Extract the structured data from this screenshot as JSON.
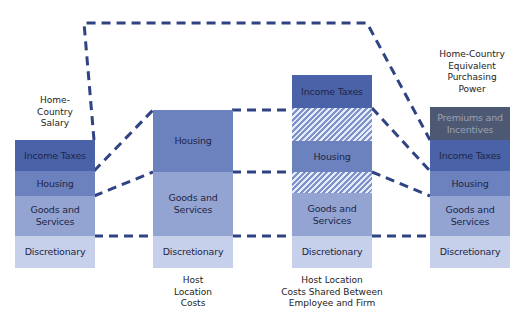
{
  "colors": {
    "income_taxes": "#4a63a8",
    "housing": "#6c82bf",
    "goods_services": "#93a4d3",
    "discretionary": "#c6d0ea",
    "premiums": "#4d5872",
    "premiums_text": "#9aa2b4",
    "connector": "#2f4383"
  },
  "columns": [
    {
      "caption": "Home-\nCountry\nSalary",
      "caption_position": "top",
      "segments": [
        {
          "label": "Income Taxes",
          "type": "income_taxes"
        },
        {
          "label": "Housing",
          "type": "housing"
        },
        {
          "label": "Goods and Services",
          "type": "goods_services"
        },
        {
          "label": "Discretionary",
          "type": "discretionary"
        }
      ]
    },
    {
      "caption": "Host\nLocation\nCosts",
      "caption_position": "bottom",
      "segments": [
        {
          "label": "Housing",
          "type": "housing"
        },
        {
          "label": "Goods and Services",
          "type": "goods_services"
        },
        {
          "label": "Discretionary",
          "type": "discretionary"
        }
      ]
    },
    {
      "caption": "Host Location\nCosts Shared Between\nEmployee and Firm",
      "caption_position": "bottom",
      "segments": [
        {
          "label": "Income Taxes",
          "type": "income_taxes"
        },
        {
          "label": "",
          "type": "hatch"
        },
        {
          "label": "Housing",
          "type": "housing"
        },
        {
          "label": "",
          "type": "hatch"
        },
        {
          "label": "Goods and Services",
          "type": "goods_services"
        },
        {
          "label": "Discretionary",
          "type": "discretionary"
        }
      ]
    },
    {
      "caption": "Home-Country\nEquivalent\nPurchasing\nPower",
      "caption_position": "top",
      "segments": [
        {
          "label": "Premiums and Incentives",
          "type": "premiums"
        },
        {
          "label": "Income Taxes",
          "type": "income_taxes"
        },
        {
          "label": "Housing",
          "type": "housing"
        },
        {
          "label": "Goods and Services",
          "type": "goods_services"
        },
        {
          "label": "Discretionary",
          "type": "discretionary"
        }
      ]
    }
  ],
  "labels": {
    "c1_title": [
      "Home-",
      "Country",
      "Salary"
    ],
    "c2_title": [
      "Host",
      "Location",
      "Costs"
    ],
    "c3_title": [
      "Host Location",
      "Costs Shared Between",
      "Employee and Firm"
    ],
    "c4_title": [
      "Home-Country",
      "Equivalent",
      "Purchasing",
      "Power"
    ],
    "income_taxes": "Income Taxes",
    "housing": "Housing",
    "goods_1": "Goods and",
    "goods_2": "Services",
    "discretionary": "Discretionary",
    "premiums_1": "Premiums and",
    "premiums_2": "Incentives"
  }
}
